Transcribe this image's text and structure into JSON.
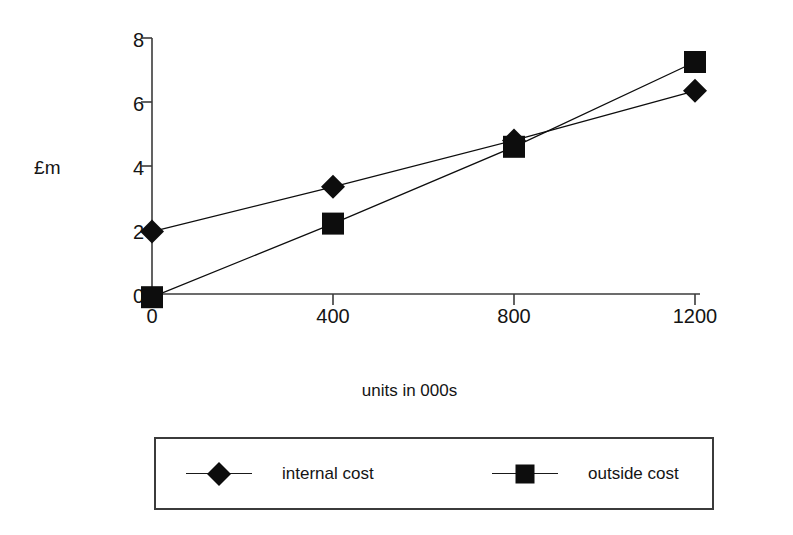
{
  "chart_data": {
    "type": "line",
    "title": "",
    "xlabel": "units in 000s",
    "ylabel": "£m",
    "x": [
      0,
      400,
      800,
      1200
    ],
    "xticklabels": [
      "0",
      "400",
      "800",
      "1200"
    ],
    "yticks": [
      0,
      2,
      4,
      6,
      8
    ],
    "yticklabels": [
      "0",
      "2",
      "4",
      "6",
      "8"
    ],
    "xlim": [
      0,
      1200
    ],
    "ylim": [
      0,
      8
    ],
    "grid": false,
    "legend_position": "bottom",
    "series": [
      {
        "name": "internal cost",
        "marker": "diamond",
        "color": "#0d0d0d",
        "values": [
          1.95,
          3.35,
          4.8,
          6.35
        ]
      },
      {
        "name": "outside cost",
        "marker": "square",
        "color": "#0d0d0d",
        "values": [
          -0.1,
          2.2,
          4.6,
          7.25
        ]
      }
    ]
  },
  "axes": {
    "y_title": "£m",
    "x_title": "units in 000s",
    "y_tick_labels": [
      "0",
      "2",
      "4",
      "6",
      "8"
    ],
    "x_tick_labels": [
      "0",
      "400",
      "800",
      "1200"
    ]
  },
  "legend": {
    "entries": [
      {
        "label": "internal cost",
        "marker": "diamond"
      },
      {
        "label": "outside cost",
        "marker": "square"
      }
    ]
  },
  "colors": {
    "ink": "#0d0d0d",
    "axis": "#3b3b3b",
    "background": "#ffffff"
  }
}
